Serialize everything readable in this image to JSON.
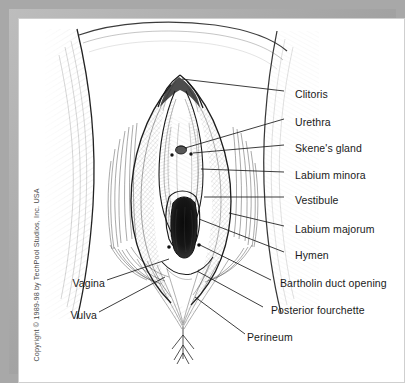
{
  "figure": {
    "style": "pen-and-ink line drawing",
    "copyright": "Copyright © 1989-98 by TechPool Studios, Inc. USA",
    "frame_color": "#a8a8a8",
    "background_color": "#ffffff",
    "ink_color": "#1a1a1a"
  },
  "labels": {
    "right": [
      {
        "id": "clitoris",
        "text": "Clitoris",
        "x": 276,
        "y": 75
      },
      {
        "id": "urethra",
        "text": "Urethra",
        "x": 276,
        "y": 103
      },
      {
        "id": "skenes-gland",
        "text": "Skene's gland",
        "x": 276,
        "y": 129
      },
      {
        "id": "labium-minora",
        "text": "Labium minora",
        "x": 276,
        "y": 156
      },
      {
        "id": "vestibule",
        "text": "Vestibule",
        "x": 276,
        "y": 181
      },
      {
        "id": "labium-majorum",
        "text": "Labium majorum",
        "x": 276,
        "y": 210
      },
      {
        "id": "hymen",
        "text": "Hymen",
        "x": 276,
        "y": 236
      },
      {
        "id": "bartholin-duct-opening",
        "text": "Bartholin duct opening",
        "x": 261,
        "y": 264
      },
      {
        "id": "posterior-fourchette",
        "text": "Posterior fourchette",
        "x": 252,
        "y": 291
      }
    ],
    "left": [
      {
        "id": "vagina",
        "text": "Vagina",
        "x": 44,
        "y": 264
      },
      {
        "id": "vulva",
        "text": "Vulva",
        "x": 44,
        "y": 296
      }
    ],
    "bottom": [
      {
        "id": "perineum",
        "text": "Perineum",
        "x": 232,
        "y": 318
      }
    ]
  }
}
